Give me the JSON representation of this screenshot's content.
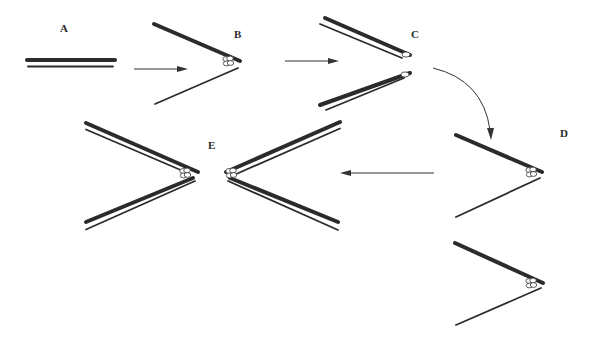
{
  "diagram": {
    "stages": [
      {
        "id": "A",
        "label": "A",
        "description": "parallel double strand"
      },
      {
        "id": "B",
        "label": "B",
        "description": "strands separated at fork with bead complex"
      },
      {
        "id": "C",
        "label": "C",
        "description": "two separated double-strand arms with end complexes"
      },
      {
        "id": "D",
        "label": "D",
        "description": "fork with bead complex (two variants)"
      },
      {
        "id": "E",
        "label": "E",
        "description": "mirrored pair of double-strand forks with bead complexes"
      }
    ],
    "arrows": [
      {
        "from": "A",
        "to": "B",
        "style": "straight"
      },
      {
        "from": "B",
        "to": "C",
        "style": "straight"
      },
      {
        "from": "C",
        "to": "D",
        "style": "curved"
      },
      {
        "from": "D",
        "to": "E",
        "style": "straight"
      }
    ],
    "colors": {
      "ink": "#2b2b2b",
      "background": "#ffffff"
    }
  }
}
